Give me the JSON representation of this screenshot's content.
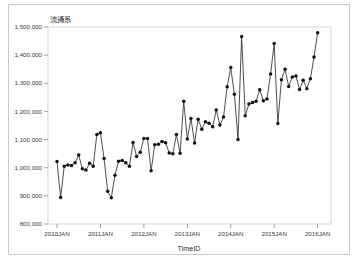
{
  "chart_data": {
    "type": "line",
    "title": "",
    "ylabel": "流通系",
    "xlabel": "TimeID",
    "ylim": [
      800000,
      1500000
    ],
    "y_ticks": [
      800000,
      900000,
      1000000,
      1100000,
      1200000,
      1300000,
      1400000,
      1500000
    ],
    "y_tick_labels": [
      "800,000",
      "900,000",
      "1,000,000",
      "1,100,000",
      "1,200,000",
      "1,300,000",
      "1,400,000",
      "1,500,000"
    ],
    "x_ticks": [
      "2010JAN",
      "2011JAN",
      "2012JAN",
      "2013JAN",
      "2014JAN",
      "2015JAN",
      "2016JAN"
    ],
    "grid": false,
    "legend": false,
    "marker": "filled-circle",
    "line_color": "#2e2e2e",
    "marker_color": "#111111",
    "x_start": "2010JAN",
    "x_end": "2016JAN",
    "x_frequency": "monthly",
    "series": [
      {
        "name": "流通系",
        "x": [
          "2010JAN",
          "2010FEB",
          "2010MAR",
          "2010APR",
          "2010MAY",
          "2010JUN",
          "2010JUL",
          "2010AUG",
          "2010SEP",
          "2010OCT",
          "2010NOV",
          "2010DEC",
          "2011JAN",
          "2011FEB",
          "2011MAR",
          "2011APR",
          "2011MAY",
          "2011JUN",
          "2011JUL",
          "2011AUG",
          "2011SEP",
          "2011OCT",
          "2011NOV",
          "2011DEC",
          "2012JAN",
          "2012FEB",
          "2012MAR",
          "2012APR",
          "2012MAY",
          "2012JUN",
          "2012JUL",
          "2012AUG",
          "2012SEP",
          "2012OCT",
          "2012NOV",
          "2012DEC",
          "2013JAN",
          "2013FEB",
          "2013MAR",
          "2013APR",
          "2013MAY",
          "2013JUN",
          "2013JUL",
          "2013AUG",
          "2013SEP",
          "2013OCT",
          "2013NOV",
          "2013DEC",
          "2014JAN",
          "2014FEB",
          "2014MAR",
          "2014APR",
          "2014MAY",
          "2014JUN",
          "2014JUL",
          "2014AUG",
          "2014SEP",
          "2014OCT",
          "2014NOV",
          "2014DEC",
          "2015JAN",
          "2015FEB",
          "2015MAR",
          "2015APR",
          "2015MAY",
          "2015JUN",
          "2015JUL",
          "2015AUG",
          "2015SEP",
          "2015OCT",
          "2015NOV",
          "2015DEC"
        ],
        "values": [
          1022000,
          894000,
          1005000,
          1010000,
          1008000,
          1018000,
          1045000,
          996000,
          992000,
          1016000,
          1005000,
          1118000,
          1124000,
          1033000,
          916000,
          893000,
          973000,
          1023000,
          1026000,
          1018000,
          1005000,
          1090000,
          1040000,
          1055000,
          1104000,
          1104000,
          989000,
          1082000,
          1083000,
          1093000,
          1089000,
          1052000,
          1050000,
          1118000,
          1051000,
          1236000,
          1102000,
          1175000,
          1088000,
          1172000,
          1137000,
          1163000,
          1158000,
          1146000,
          1205000,
          1152000,
          1180000,
          1288000,
          1356000,
          1261000,
          1100000,
          1466000,
          1185000,
          1226000,
          1232000,
          1236000,
          1277000,
          1238000,
          1244000,
          1333000,
          1441000,
          1157000,
          1313000,
          1350000,
          1289000,
          1322000,
          1326000,
          1278000,
          1311000,
          1281000,
          1316000,
          1393000
        ]
      },
      {
        "name": "tail",
        "x": [
          "2015DEC+"
        ],
        "values": [
          1480000
        ]
      }
    ]
  },
  "axis": {
    "y_name": "流通系",
    "x_name": "TimeID"
  }
}
